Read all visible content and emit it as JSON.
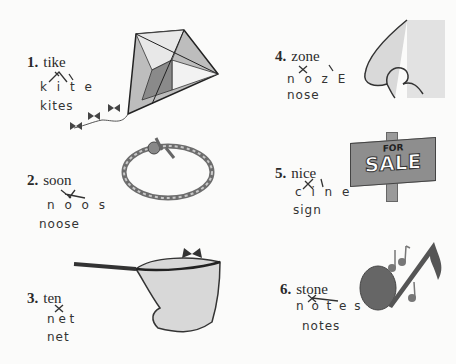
{
  "worksheet": {
    "items": [
      {
        "number": "1.",
        "word": "tike",
        "scrambled": "k i t e",
        "answer": "kites",
        "picture": "kite"
      },
      {
        "number": "2.",
        "word": "soon",
        "scrambled": "n o o s",
        "answer": "noose",
        "picture": "rope-noose"
      },
      {
        "number": "3.",
        "word": "ten",
        "scrambled": "n e t",
        "answer": "net",
        "picture": "butterfly-net"
      },
      {
        "number": "4.",
        "word": "zone",
        "scrambled": "n o z E",
        "answer": "nose",
        "picture": "nose"
      },
      {
        "number": "5.",
        "word": "nice",
        "scrambled": "c i n e",
        "answer": "sign",
        "picture": "for-sale-sign"
      },
      {
        "number": "6.",
        "word": "stone",
        "scrambled": "n o t e s",
        "answer": "notes",
        "picture": "music-notes"
      }
    ],
    "sign_text": {
      "top": "FOR",
      "bottom": "SALE"
    }
  },
  "colors": {
    "background": "#fbfbfa",
    "ink": "#333333",
    "sign_board": "#8e8e8e",
    "nose_shade": "#d9d9d9",
    "note_fill": "#666666"
  }
}
